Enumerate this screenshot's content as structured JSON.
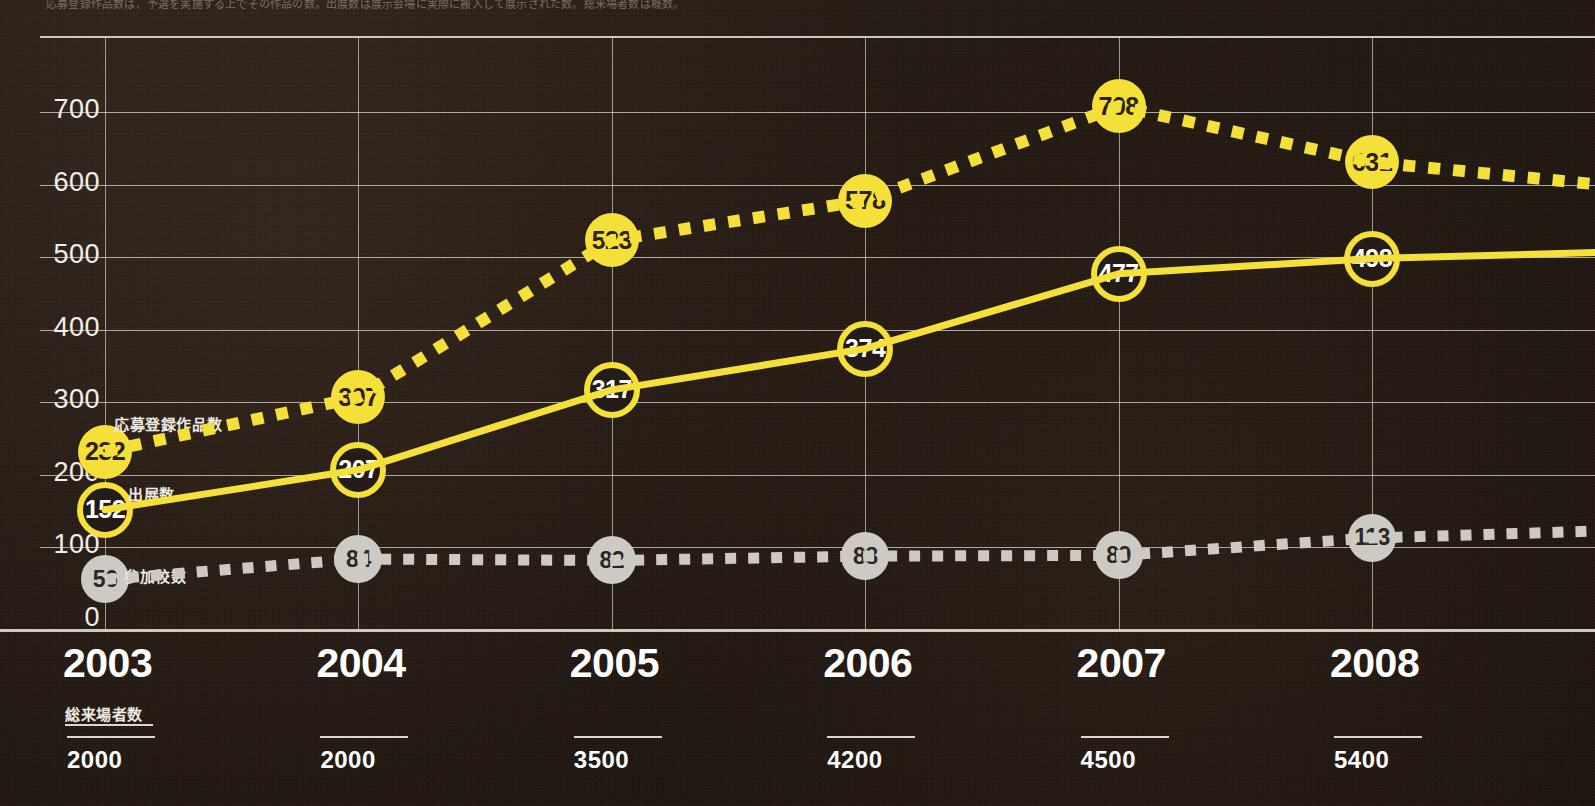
{
  "caption": {
    "top_text_partial": "応募登録作品数は、予選を実施する上でその作品の数。出展数は展示会場に実際に搬入して展示された数。総来場者数は概数。"
  },
  "chart_data": {
    "type": "line",
    "title": "",
    "subtitle": "",
    "xlabel": "",
    "ylabel": "",
    "ylim": [
      0,
      740
    ],
    "yticks": [
      0,
      100,
      200,
      300,
      400,
      500,
      600,
      700
    ],
    "grid": true,
    "legend_position": "inline-left",
    "categories": [
      "2003",
      "2004",
      "2005",
      "2006",
      "2007",
      "2008"
    ],
    "series": [
      {
        "name": "応募登録作品数",
        "style": "dotted",
        "color": "#f4e038",
        "marker": "filled-yellow",
        "values": [
          232,
          307,
          523,
          578,
          708,
          631
        ]
      },
      {
        "name": "出展数",
        "style": "solid",
        "color": "#f4e038",
        "marker": "ring-yellow",
        "values": [
          152,
          207,
          317,
          374,
          477,
          498
        ]
      },
      {
        "name": "参加校数",
        "style": "dotted",
        "color": "#cdcac4",
        "marker": "filled-gray",
        "values": [
          56,
          84,
          82,
          88,
          89,
          113
        ]
      }
    ],
    "annotations": [
      {
        "label": "応募登録作品数",
        "at": "2003"
      },
      {
        "label": "出展数",
        "at": "2003"
      },
      {
        "label": "参加校数",
        "at": "2003"
      }
    ],
    "secondary_table": {
      "title": "総来場者数",
      "categories": [
        "2003",
        "2004",
        "2005",
        "2006",
        "2007",
        "2008"
      ],
      "values": [
        "2000",
        "2000",
        "3500",
        "4200",
        "4500",
        "5400"
      ]
    }
  },
  "colors": {
    "background": "#241c16",
    "accent_yellow": "#f4e038",
    "gray_series": "#cdcac4",
    "grid": "#d6d0c6",
    "text": "#ffffff"
  }
}
